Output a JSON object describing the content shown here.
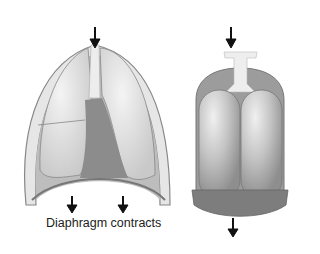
{
  "figure": {
    "caption": "Diaphragm contracts",
    "panels": [
      {
        "name": "thoracic-cavity",
        "description": "Chest cavity with lungs; diaphragm moving down"
      },
      {
        "name": "bell-jar-model",
        "description": "Bell jar lung model with balloons; rubber sheet pulled down"
      }
    ],
    "arrows": [
      {
        "panel": "thoracic-cavity",
        "position": "trachea-top",
        "direction": "down"
      },
      {
        "panel": "thoracic-cavity",
        "position": "diaphragm-left",
        "direction": "down"
      },
      {
        "panel": "thoracic-cavity",
        "position": "diaphragm-right",
        "direction": "down"
      },
      {
        "panel": "bell-jar-model",
        "position": "tube-top",
        "direction": "down"
      },
      {
        "panel": "bell-jar-model",
        "position": "bottom-sheet",
        "direction": "down"
      }
    ]
  }
}
